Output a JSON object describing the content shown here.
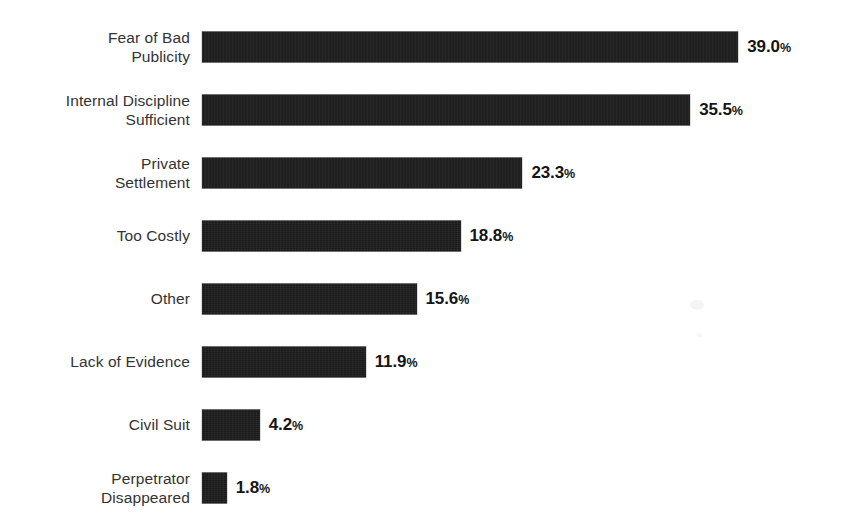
{
  "chart_data": {
    "type": "bar",
    "orientation": "horizontal",
    "title": "",
    "subtitle": "",
    "xlabel": "",
    "ylabel": "",
    "grid": false,
    "legend": false,
    "legend_position": "none",
    "axis_visible": false,
    "tick_labels_x": [],
    "xlim": [
      0,
      39.0
    ],
    "value_suffix": "%",
    "categories": [
      "Fear of Bad\nPublicity",
      "Internal Discipline\nSufficient",
      "Private\nSettlement",
      "Too Costly",
      "Other",
      "Lack of Evidence",
      "Civil Suit",
      "Perpetrator\nDisappeared"
    ],
    "values": [
      39.0,
      35.5,
      23.3,
      18.8,
      15.6,
      11.9,
      4.2,
      1.8
    ],
    "value_labels": [
      "39.0",
      "35.5",
      "23.3",
      "18.8",
      "15.6",
      "11.9",
      "4.2",
      "1.8"
    ],
    "bar_color": "#1c1c1c",
    "label_color": "#333333",
    "value_color": "#151515",
    "background_color": "#ffffff"
  },
  "rows": [
    {
      "label": "Fear of Bad\nPublicity",
      "value": 39.0,
      "value_number": "39.0",
      "percent_sign": "%"
    },
    {
      "label": "Internal Discipline\nSufficient",
      "value": 35.5,
      "value_number": "35.5",
      "percent_sign": "%"
    },
    {
      "label": "Private\nSettlement",
      "value": 23.3,
      "value_number": "23.3",
      "percent_sign": "%"
    },
    {
      "label": "Too Costly",
      "value": 18.8,
      "value_number": "18.8",
      "percent_sign": "%"
    },
    {
      "label": "Other",
      "value": 15.6,
      "value_number": "15.6",
      "percent_sign": "%"
    },
    {
      "label": "Lack of Evidence",
      "value": 11.9,
      "value_number": "11.9",
      "percent_sign": "%"
    },
    {
      "label": "Civil Suit",
      "value": 4.2,
      "value_number": "4.2",
      "percent_sign": "%"
    },
    {
      "label": "Perpetrator\nDisappeared",
      "value": 1.8,
      "value_number": "1.8",
      "percent_sign": "%"
    }
  ],
  "geometry": {
    "bar_origin_x": 202,
    "px_per_percent": 13.75,
    "row_pitch": 63,
    "first_row_top": 15,
    "bar_height": 31,
    "label_right_edge": 190
  }
}
